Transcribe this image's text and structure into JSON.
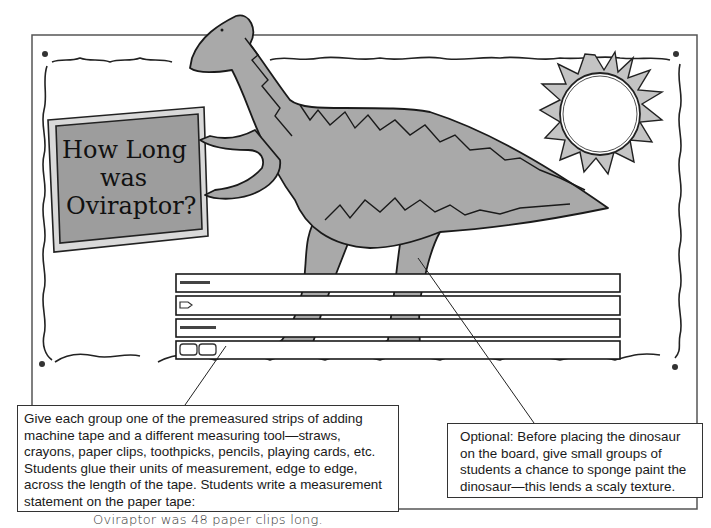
{
  "sign": {
    "line1": "How Long",
    "line2": "was",
    "line3": "Oviraptor?"
  },
  "tapes": [
    {
      "unit": "straws",
      "count": 0
    },
    {
      "unit": "crayons",
      "count": 0
    },
    {
      "unit": "toothpicks",
      "count": 0
    },
    {
      "unit": "playing-cards",
      "count": 0
    }
  ],
  "callouts": {
    "left": {
      "text": "Give each group one of the premeasured strips of adding machine tape and a different measuring tool—straws, crayons, paper clips, toothpicks, pencils, playing cards, etc. Students glue their units of measurement, edge to edge, across the length of the tape. Students write a measurement statement on the paper tape:",
      "example": "Oviraptor was 48 paper clips long."
    },
    "right": {
      "text": "Optional: Before placing the dinosaur on the board, give small groups of students a chance to sponge paint the dinosaur—this lends a scaly texture."
    }
  },
  "colors": {
    "dino_fill": "#a9a9a9",
    "sign_fill": "#9d9d9d",
    "sun_rays": "#c4c4c4",
    "ink": "#1a1a1a"
  }
}
